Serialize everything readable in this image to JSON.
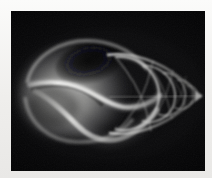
{
  "image": {
    "kind": "radiograph-photograph",
    "subject": "seashell",
    "subject_detail": "gastropod shell x-ray, whelk-like, body whorl at left, tapering spire to the right",
    "orientation": "landscape",
    "alt_text": "X-ray radiograph of a spiral seashell on a black background",
    "caption": ""
  },
  "colors": {
    "border": "#f3f3f1",
    "plate_background": "#020203",
    "shell_bright": "#e8e8e6",
    "shell_mid": "#9a9a98",
    "shell_dim": "#4a4a4c",
    "shell_faint": "#26262a"
  },
  "geometry": {
    "canvas_width": 212,
    "canvas_height": 178,
    "plate_x": 11,
    "plate_y": 11,
    "plate_width": 194,
    "plate_height": 160,
    "shell_apex_x": 190,
    "shell_apex_y": 85,
    "body_center_x": 52,
    "body_center_y": 84
  },
  "regions": [
    {
      "name": "body-whorl",
      "label": "body whorl"
    },
    {
      "name": "aperture",
      "label": "aperture"
    },
    {
      "name": "columella",
      "label": "columella"
    },
    {
      "name": "spire",
      "label": "spire"
    },
    {
      "name": "apex",
      "label": "apex"
    },
    {
      "name": "suture-lines",
      "label": "suture lines"
    }
  ]
}
